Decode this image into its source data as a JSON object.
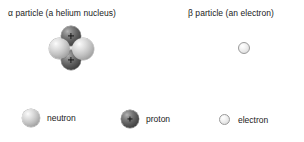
{
  "figure": {
    "title_alpha": "α particle (a helium nucleus)",
    "title_beta": "β particle (an electron)"
  },
  "alpha_particle": {
    "label": "α particle (a helium nucleus)",
    "composition": [
      {
        "name": "proton",
        "charge": "+",
        "position": "top",
        "color": "#4a4a4a"
      },
      {
        "name": "neutron",
        "charge": "",
        "position": "left",
        "color": "#c3c3c3"
      },
      {
        "name": "neutron",
        "charge": "",
        "position": "right",
        "color": "#c3c3c3"
      },
      {
        "name": "proton",
        "charge": "+",
        "position": "bottom",
        "color": "#4a4a4a"
      }
    ],
    "proton_symbol": "+"
  },
  "beta_particle": {
    "label": "β particle (an electron)",
    "composition": [
      {
        "name": "electron",
        "charge": "",
        "color": "#eaeaea"
      }
    ]
  },
  "legend": {
    "items": [
      {
        "label": "neutron",
        "icon": "neutron-sphere",
        "color": "#c3c3c3",
        "symbol": ""
      },
      {
        "label": "proton",
        "icon": "proton-sphere",
        "color": "#4a4a4a",
        "symbol": "+"
      },
      {
        "label": "electron",
        "icon": "electron-circle",
        "color": "#eaeaea",
        "symbol": ""
      }
    ]
  },
  "colors": {
    "background": "#ffffff",
    "text": "#1a1a1a",
    "neutron": "#c3c3c3",
    "proton": "#4a4a4a",
    "electron": "#eaeaea"
  }
}
